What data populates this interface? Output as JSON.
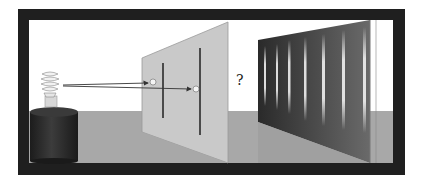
{
  "diagram": {
    "question_label": "?",
    "elements": {
      "light_source": "lamp-on-cylinder",
      "barrier": "screen-with-two-slits",
      "detector_screen": "interference-pattern-screen"
    },
    "interference_fringes": 7,
    "colors": {
      "frame": "#1f1f1f",
      "sky": "#ffffff",
      "floor": "#a8a8a8",
      "barrier": "#c9c9c9",
      "detector_screen": "#4a4a4a",
      "fringe": "#e0e0e0",
      "cylinder": "#2e2e2e"
    }
  }
}
